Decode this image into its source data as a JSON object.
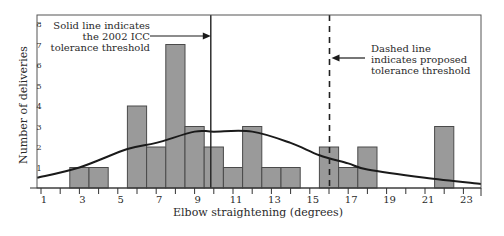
{
  "chart_data": {
    "type": "bar",
    "title": "",
    "xlabel": "Elbow straightening (degrees)",
    "ylabel": "Number of deliveries",
    "xlim": [
      0.5,
      24
    ],
    "ylim": [
      0,
      8
    ],
    "x_ticks": [
      1,
      2,
      3,
      4,
      5,
      6,
      7,
      8,
      9,
      10,
      11,
      12,
      13,
      14,
      15,
      16,
      17,
      18,
      19,
      20,
      21,
      22,
      23
    ],
    "x_tick_labels": [
      "1",
      "3",
      "5",
      "7",
      "9",
      "11",
      "13",
      "15",
      "17",
      "19",
      "21",
      "23"
    ],
    "y_tick_labels": [
      "1",
      "2",
      "3",
      "4",
      "5",
      "6",
      "7",
      "8"
    ],
    "bars": [
      {
        "x_start": 2.5,
        "x_end": 3.5,
        "value": 1
      },
      {
        "x_start": 3.5,
        "x_end": 4.5,
        "value": 1
      },
      {
        "x_start": 5.5,
        "x_end": 6.5,
        "value": 4
      },
      {
        "x_start": 6.5,
        "x_end": 7.5,
        "value": 2
      },
      {
        "x_start": 7.5,
        "x_end": 8.5,
        "value": 7
      },
      {
        "x_start": 8.5,
        "x_end": 9.5,
        "value": 3
      },
      {
        "x_start": 9.5,
        "x_end": 10.5,
        "value": 2
      },
      {
        "x_start": 10.5,
        "x_end": 11.5,
        "value": 1
      },
      {
        "x_start": 11.5,
        "x_end": 12.5,
        "value": 3
      },
      {
        "x_start": 12.5,
        "x_end": 13.5,
        "value": 1
      },
      {
        "x_start": 13.5,
        "x_end": 14.5,
        "value": 1
      },
      {
        "x_start": 15.5,
        "x_end": 16.5,
        "value": 2
      },
      {
        "x_start": 16.5,
        "x_end": 17.5,
        "value": 1
      },
      {
        "x_start": 17.5,
        "x_end": 18.5,
        "value": 2
      },
      {
        "x_start": 21.5,
        "x_end": 22.5,
        "value": 3
      }
    ],
    "series": [
      {
        "name": "Fitted distribution curve",
        "type": "line",
        "x": [
          0.8,
          3,
          5.5,
          7,
          9,
          10,
          12,
          14,
          15.5,
          17,
          18,
          21,
          24
        ],
        "y": [
          0.5,
          1.0,
          1.9,
          2.2,
          2.75,
          2.75,
          2.75,
          2.2,
          1.6,
          1.2,
          0.9,
          0.5,
          0.2
        ]
      }
    ],
    "reference_lines": [
      {
        "x": 10,
        "style": "solid",
        "label": "2002 ICC tolerance threshold"
      },
      {
        "x": 16,
        "style": "dashed",
        "label": "Proposed tolerance threshold"
      }
    ],
    "annotations": [
      {
        "lines": [
          "Solid line indicates",
          "the 2002 ICC",
          "tolerance threshold"
        ],
        "points_to": "solid-line"
      },
      {
        "lines": [
          "Dashed line",
          "indicates proposed",
          "tolerance threshold"
        ],
        "points_to": "dashed-line"
      }
    ],
    "grid": false,
    "legend": "none"
  },
  "colors": {
    "bar_fill": "#9a9a9a",
    "bar_stroke": "#4a4a4a",
    "axis": "#333333",
    "curve": "#1a1a1a"
  }
}
